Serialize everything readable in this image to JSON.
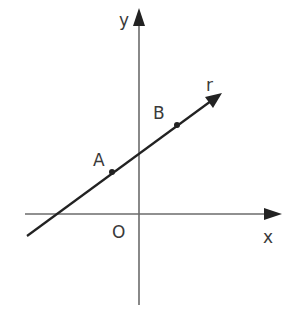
{
  "diagram": {
    "type": "cartesian-line",
    "colors": {
      "axis": "#6b6b6b",
      "line": "#222222",
      "text": "#3a3a3a",
      "background": "#ffffff"
    },
    "axes": {
      "x": {
        "label": "x",
        "y": 214,
        "x1": 25,
        "x2": 282
      },
      "y": {
        "label": "y",
        "x": 139,
        "y1": 305,
        "y2": 8
      },
      "origin": {
        "label": "O"
      }
    },
    "line": {
      "label": "r",
      "x1": 27,
      "y1": 236,
      "x2": 222,
      "y2": 93
    },
    "points": [
      {
        "label": "A",
        "x": 112,
        "y": 172
      },
      {
        "label": "B",
        "x": 177,
        "y": 125
      }
    ]
  }
}
